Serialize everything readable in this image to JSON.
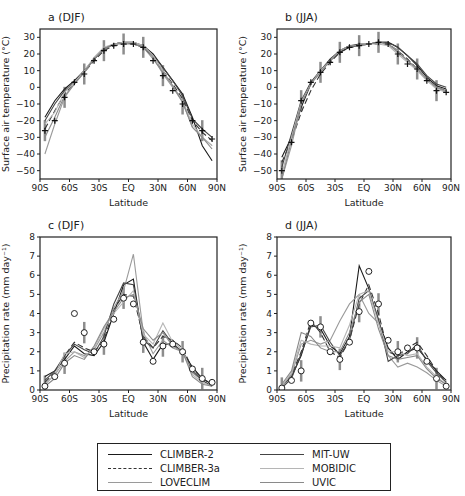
{
  "chart_data": [
    {
      "type": "line",
      "panel": "a",
      "title": "a  (DJF)",
      "xlabel": "Latitude",
      "ylabel": "Surface air temperature (°C)",
      "xticks": [
        "90S",
        "60S",
        "30S",
        "EQ",
        "30N",
        "60N",
        "90N"
      ],
      "yticks": [
        30,
        20,
        10,
        0,
        -10,
        -20,
        -30,
        -40,
        -50
      ],
      "ylim": [
        -55,
        35
      ],
      "x": [
        -85,
        -75,
        -65,
        -55,
        -45,
        -35,
        -25,
        -15,
        -5,
        5,
        15,
        25,
        35,
        45,
        55,
        65,
        75,
        85
      ],
      "series": [
        {
          "name": "CLIMBER-2",
          "values": [
            -18,
            -8,
            -1,
            4,
            10,
            17,
            23,
            26,
            27,
            27,
            25,
            20,
            12,
            4,
            -4,
            -18,
            -35,
            -44
          ]
        },
        {
          "name": "CLIMBER-3a",
          "values": [
            -25,
            -14,
            -4,
            3,
            9,
            16,
            22,
            25,
            26,
            26,
            24,
            18,
            10,
            2,
            -7,
            -20,
            -27,
            -32
          ]
        },
        {
          "name": "LOVECLIM",
          "values": [
            -40,
            -22,
            -6,
            2,
            9,
            17,
            23,
            26,
            27,
            27,
            25,
            18,
            8,
            0,
            -9,
            -24,
            -30,
            -35
          ]
        },
        {
          "name": "MIT-UW",
          "values": [
            -20,
            -10,
            -2,
            3,
            10,
            17,
            23,
            26,
            27,
            26,
            24,
            19,
            12,
            4,
            -5,
            -19,
            -25,
            -30
          ]
        },
        {
          "name": "MOBIDIC",
          "values": [
            -22,
            -15,
            -3,
            3,
            10,
            18,
            24,
            26,
            27,
            27,
            25,
            19,
            10,
            1,
            -8,
            -22,
            -30,
            -35
          ]
        },
        {
          "name": "UVIC",
          "values": [
            -30,
            -18,
            -5,
            2,
            9,
            17,
            23,
            26,
            26,
            26,
            24,
            17,
            9,
            1,
            -9,
            -24,
            -30,
            -37
          ]
        },
        {
          "name": "Observations",
          "values": [
            -26,
            -20,
            -6,
            3,
            8,
            16,
            22,
            25,
            26,
            26,
            24,
            16,
            7,
            -2,
            -10,
            -20,
            -26,
            -31
          ]
        }
      ]
    },
    {
      "type": "line",
      "panel": "b",
      "title": "b  (JJA)",
      "xlabel": "Latitude",
      "ylabel": "Surface air temperature (°C)",
      "xticks": [
        "90S",
        "60S",
        "30S",
        "EQ",
        "30N",
        "60N",
        "90N"
      ],
      "yticks": [
        30,
        20,
        10,
        0,
        -10,
        -20,
        -30,
        -40,
        -50
      ],
      "ylim": [
        -55,
        35
      ],
      "x": [
        -85,
        -75,
        -65,
        -55,
        -45,
        -35,
        -25,
        -15,
        -5,
        5,
        15,
        25,
        35,
        45,
        55,
        65,
        75,
        85
      ],
      "series": [
        {
          "name": "CLIMBER-2",
          "values": [
            -42,
            -30,
            -12,
            2,
            10,
            16,
            21,
            24,
            25,
            26,
            27,
            27,
            24,
            19,
            13,
            6,
            1,
            -1
          ]
        },
        {
          "name": "CLIMBER-3a",
          "values": [
            -45,
            -32,
            -15,
            -2,
            8,
            15,
            21,
            24,
            25,
            26,
            26,
            26,
            22,
            17,
            11,
            5,
            0,
            -2
          ]
        },
        {
          "name": "LOVECLIM",
          "values": [
            -55,
            -35,
            -10,
            3,
            10,
            16,
            22,
            25,
            25,
            26,
            27,
            26,
            22,
            16,
            11,
            5,
            0,
            -3
          ]
        },
        {
          "name": "MIT-UW",
          "values": [
            -48,
            -28,
            -8,
            3,
            10,
            17,
            22,
            25,
            26,
            26,
            27,
            27,
            24,
            19,
            14,
            7,
            2,
            0
          ]
        },
        {
          "name": "MOBIDIC",
          "values": [
            -52,
            -30,
            -9,
            2,
            10,
            16,
            22,
            25,
            25,
            26,
            26,
            25,
            20,
            15,
            10,
            4,
            -1,
            -3
          ]
        },
        {
          "name": "UVIC",
          "values": [
            -55,
            -32,
            -10,
            2,
            9,
            16,
            22,
            25,
            25,
            26,
            27,
            26,
            21,
            16,
            11,
            5,
            0,
            -2
          ]
        },
        {
          "name": "Observations",
          "values": [
            -50,
            -33,
            -8,
            3,
            9,
            15,
            21,
            24,
            25,
            26,
            27,
            26,
            20,
            14,
            11,
            4,
            -2,
            -3
          ]
        }
      ]
    },
    {
      "type": "line",
      "panel": "c",
      "title": "c  (DJF)",
      "xlabel": "Latitude",
      "ylabel": "Precipitation rate (mm day⁻¹)",
      "xticks": [
        "90S",
        "60S",
        "30S",
        "EQ",
        "30N",
        "60N",
        "90N"
      ],
      "yticks": [
        0,
        1,
        2,
        3,
        4,
        5,
        6,
        7,
        8
      ],
      "ylim": [
        0,
        8
      ],
      "x": [
        -85,
        -75,
        -65,
        -55,
        -45,
        -35,
        -25,
        -15,
        -5,
        5,
        15,
        25,
        35,
        45,
        55,
        65,
        75,
        85
      ],
      "series": [
        {
          "name": "CLIMBER-2",
          "values": [
            0.7,
            1.0,
            1.6,
            2.3,
            1.9,
            1.8,
            2.5,
            4.0,
            5.5,
            5.8,
            2.5,
            1.6,
            2.4,
            2.4,
            2.0,
            1.2,
            0.6,
            0.3
          ]
        },
        {
          "name": "CLIMBER-3a",
          "values": [
            0.4,
            0.9,
            1.8,
            2.5,
            2.2,
            2.0,
            2.6,
            4.2,
            5.0,
            4.9,
            2.8,
            2.2,
            2.8,
            2.6,
            2.2,
            1.1,
            0.6,
            0.3
          ]
        },
        {
          "name": "LOVECLIM",
          "values": [
            0.3,
            0.8,
            1.5,
            2.0,
            1.8,
            2.1,
            3.0,
            4.3,
            5.2,
            7.1,
            3.0,
            1.9,
            2.6,
            2.2,
            2.0,
            0.9,
            0.5,
            0.2
          ]
        },
        {
          "name": "MIT-UW",
          "values": [
            0.5,
            1.0,
            1.8,
            2.4,
            2.1,
            1.9,
            2.8,
            4.5,
            5.6,
            5.5,
            2.6,
            2.2,
            3.1,
            2.4,
            2.0,
            1.0,
            0.5,
            0.2
          ]
        },
        {
          "name": "MOBIDIC",
          "values": [
            0.3,
            0.8,
            1.9,
            2.0,
            1.7,
            2.2,
            3.2,
            4.0,
            4.6,
            5.2,
            2.9,
            2.4,
            3.5,
            2.5,
            2.1,
            0.8,
            0.4,
            0.2
          ]
        },
        {
          "name": "UVIC",
          "values": [
            0.2,
            0.6,
            1.4,
            1.8,
            1.6,
            2.3,
            3.3,
            4.1,
            4.8,
            5.0,
            3.2,
            2.6,
            3.0,
            2.3,
            2.0,
            0.7,
            0.3,
            0.2
          ]
        },
        {
          "name": "Observations",
          "values": [
            0.2,
            0.7,
            1.4,
            4.0,
            3.0,
            2.0,
            2.4,
            3.7,
            4.8,
            4.5,
            2.5,
            1.5,
            2.3,
            2.4,
            2.0,
            1.1,
            0.6,
            0.4
          ]
        }
      ]
    },
    {
      "type": "line",
      "panel": "d",
      "title": "d  (JJA)",
      "xlabel": "Latitude",
      "ylabel": "Precipitation rate (mm day⁻¹)",
      "xticks": [
        "90S",
        "60S",
        "30S",
        "EQ",
        "30N",
        "60N",
        "90N"
      ],
      "yticks": [
        0,
        1,
        2,
        3,
        4,
        5,
        6,
        7,
        8
      ],
      "ylim": [
        0,
        8
      ],
      "x": [
        -85,
        -75,
        -65,
        -55,
        -45,
        -35,
        -25,
        -15,
        -5,
        5,
        15,
        25,
        35,
        45,
        55,
        65,
        75,
        85
      ],
      "series": [
        {
          "name": "CLIMBER-2",
          "values": [
            0.2,
            0.7,
            1.8,
            3.4,
            3.2,
            2.3,
            1.9,
            2.8,
            6.5,
            5.3,
            3.6,
            2.2,
            1.6,
            2.0,
            2.2,
            1.6,
            1.0,
            0.5
          ]
        },
        {
          "name": "CLIMBER-3a",
          "values": [
            0.2,
            0.8,
            2.0,
            3.6,
            3.0,
            2.0,
            1.7,
            2.6,
            4.5,
            5.5,
            4.0,
            2.0,
            1.8,
            2.2,
            2.5,
            1.8,
            1.0,
            0.4
          ]
        },
        {
          "name": "LOVECLIM",
          "values": [
            0.2,
            0.8,
            2.4,
            2.6,
            2.4,
            2.6,
            3.6,
            4.5,
            5.0,
            4.0,
            3.5,
            1.8,
            1.2,
            1.4,
            1.2,
            0.9,
            0.5,
            0.2
          ]
        },
        {
          "name": "MIT-UW",
          "values": [
            0.1,
            0.6,
            1.9,
            3.3,
            3.4,
            2.5,
            1.8,
            2.6,
            4.8,
            5.2,
            3.7,
            1.5,
            1.8,
            1.9,
            2.4,
            1.5,
            0.9,
            0.4
          ]
        },
        {
          "name": "MOBIDIC",
          "values": [
            0.2,
            0.9,
            2.6,
            2.4,
            2.3,
            2.3,
            2.2,
            3.4,
            5.0,
            5.2,
            3.5,
            2.0,
            2.0,
            1.8,
            1.9,
            1.2,
            0.7,
            0.3
          ]
        },
        {
          "name": "UVIC",
          "values": [
            0.3,
            1.0,
            3.0,
            2.8,
            2.2,
            2.0,
            2.0,
            3.0,
            4.6,
            5.0,
            3.2,
            1.8,
            1.6,
            1.7,
            1.8,
            1.1,
            0.6,
            0.3
          ]
        },
        {
          "name": "Observations",
          "values": [
            0.1,
            0.5,
            1.0,
            3.5,
            3.3,
            2.0,
            1.6,
            2.5,
            4.1,
            6.2,
            4.5,
            2.6,
            2.0,
            2.2,
            2.2,
            1.5,
            0.6,
            0.2
          ]
        }
      ]
    }
  ],
  "panels": {
    "a": {
      "title": "a  (DJF)",
      "ylabel": "Surface air temperature (°C)",
      "xlabel": "Latitude"
    },
    "b": {
      "title": "b  (JJA)",
      "ylabel": "Surface air temperature (°C)",
      "xlabel": "Latitude"
    },
    "c": {
      "title": "c  (DJF)",
      "ylabel": "Precipitation rate (mm day⁻¹)",
      "xlabel": "Latitude"
    },
    "d": {
      "title": "d  (JJA)",
      "ylabel": "Precipitation rate (mm day⁻¹)",
      "xlabel": "Latitude"
    }
  },
  "legend": {
    "items": [
      {
        "label": "CLIMBER-2",
        "color": "#1a1a1a",
        "dash": ""
      },
      {
        "label": "CLIMBER-3a",
        "color": "#333333",
        "dash": "10,6"
      },
      {
        "label": "LOVECLIM",
        "color": "#9a9a9a",
        "dash": ""
      },
      {
        "label": "MIT-UW",
        "color": "#444444",
        "dash": ""
      },
      {
        "label": "MOBIDIC",
        "color": "#b5b5b5",
        "dash": ""
      },
      {
        "label": "UVIC",
        "color": "#8a8a8a",
        "dash": ""
      }
    ]
  }
}
